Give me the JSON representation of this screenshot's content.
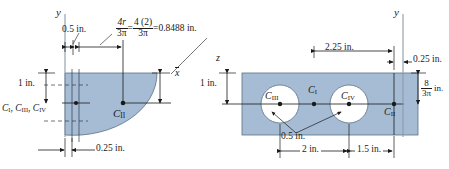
{
  "figure": {
    "colors": {
      "fill": "#a6bcd4",
      "fill_dark": "#93adc9",
      "line": "#1a1a1a",
      "axis": "#6f7f90",
      "hole": "#ffffff",
      "background": "#ffffff"
    }
  },
  "left_view": {
    "axis_y_label": "y",
    "dim_top_left": "0.5 in.",
    "dim_bottom": "0.25 in.",
    "dim_height": "1 in.",
    "xbar_label": "x",
    "centroid_group_label": {
      "c1": "C",
      "c1_sub": "I",
      "c3": "C",
      "c3_sub": "III",
      "c4": "C",
      "c4_sub": "IV",
      "full": "C I , C III , C IV"
    },
    "centroid_quarter_label": "C",
    "centroid_quarter_sub": "II",
    "formula": {
      "term1_num": "4r",
      "term1_den": "3π",
      "eq1": "=",
      "term2_num": "4 (2)",
      "term2_den": "3π",
      "eq2": "=",
      "result": "0.8488 in."
    }
  },
  "right_view": {
    "axis_y_label": "y",
    "axis_z_label": "z",
    "dim_height": "1 in.",
    "dim_top": "2.25 in.",
    "dim_top_right": "0.25 in.",
    "dim_right_num": "8",
    "dim_right_den": "3π",
    "dim_right_unit": "in.",
    "dim_radius": "0.5 in.",
    "dim_bottom_left": "2 in.",
    "dim_bottom_right": "1.5 in.",
    "centroid_I": "C",
    "centroid_I_sub": "I",
    "centroid_II": "C",
    "centroid_II_sub": "II",
    "centroid_III": "C",
    "centroid_III_sub": "III",
    "centroid_IV": "C",
    "centroid_IV_sub": "IV"
  }
}
